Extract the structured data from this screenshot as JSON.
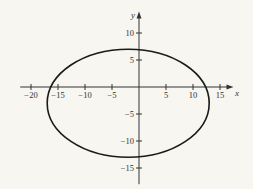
{
  "chart_data": {
    "type": "line",
    "title": "",
    "xlabel": "x",
    "ylabel": "y",
    "xlim": [
      -22,
      17.5
    ],
    "ylim": [
      -18,
      14
    ],
    "grid": false,
    "legend": null,
    "x_ticks": [
      -20,
      -15,
      -10,
      -5,
      5,
      10,
      15
    ],
    "y_ticks": [
      10,
      5,
      -5,
      -10,
      -15
    ],
    "x_tick_labels": [
      "−20",
      "−15",
      "−10",
      "−5",
      "5",
      "10",
      "15"
    ],
    "y_tick_labels": [
      "10",
      "5",
      "−5",
      "−10",
      "−15"
    ],
    "series": [
      {
        "name": "ellipse",
        "shape": "ellipse",
        "center": [
          -2,
          -3
        ],
        "semi_axis_x": 15,
        "semi_axis_y": 10,
        "equation": "(x+2)^2/225 + (y+3)^2/100 = 1",
        "x_intercepts": [
          -16.3,
          12.3
        ],
        "y_intercepts": [
          6.9,
          -12.9
        ]
      }
    ],
    "colors": {
      "curve": "#1a1a1a",
      "axes": "#333333",
      "background": "#f7f6f1"
    }
  },
  "axes": {
    "x_label": "x",
    "y_label": "y"
  }
}
